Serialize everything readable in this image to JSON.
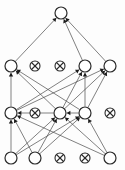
{
  "figure": {
    "width": 125,
    "height": 170,
    "background_color": "#fdfdfd",
    "node_fill_color": "#ffffff",
    "node_stroke_color": "#2b2b2b",
    "edge_color": "#4a4a4a",
    "arrow_color": "#1c1c1c"
  },
  "legend": {
    "open_circle_meaning": "open-circle-node",
    "crossed_circle_meaning": "crossed-out-circle-node"
  },
  "chart_data": {
    "type": "diagram",
    "subtype": "layered-directed-graph",
    "layers": [
      {
        "index": 0,
        "name": "row-top",
        "y": 13,
        "nodes": [
          {
            "id": "n0",
            "x": 61,
            "y": 13,
            "r": 6,
            "kind": "open",
            "label": ""
          }
        ]
      },
      {
        "index": 1,
        "name": "row-two",
        "y": 66,
        "nodes": [
          {
            "id": "n1",
            "x": 11,
            "y": 66,
            "r": 6,
            "kind": "open",
            "label": ""
          },
          {
            "id": "n2",
            "x": 35,
            "y": 66,
            "r": 5,
            "kind": "crossed",
            "label": ""
          },
          {
            "id": "n3",
            "x": 60,
            "y": 66,
            "r": 5,
            "kind": "crossed",
            "label": ""
          },
          {
            "id": "n4",
            "x": 85,
            "y": 66,
            "r": 6,
            "kind": "open",
            "label": ""
          },
          {
            "id": "n5",
            "x": 110,
            "y": 66,
            "r": 6,
            "kind": "open",
            "label": ""
          }
        ]
      },
      {
        "index": 2,
        "name": "row-three",
        "y": 113,
        "nodes": [
          {
            "id": "n6",
            "x": 11,
            "y": 113,
            "r": 6,
            "kind": "open",
            "label": ""
          },
          {
            "id": "n7",
            "x": 35,
            "y": 113,
            "r": 5,
            "kind": "crossed",
            "label": ""
          },
          {
            "id": "n8",
            "x": 60,
            "y": 113,
            "r": 6,
            "kind": "open",
            "label": ""
          },
          {
            "id": "n9",
            "x": 85,
            "y": 113,
            "r": 6,
            "kind": "open",
            "label": ""
          },
          {
            "id": "n10",
            "x": 110,
            "y": 113,
            "r": 5,
            "kind": "crossed",
            "label": ""
          }
        ]
      },
      {
        "index": 3,
        "name": "row-bottom",
        "y": 158,
        "nodes": [
          {
            "id": "n11",
            "x": 11,
            "y": 158,
            "r": 6,
            "kind": "open",
            "label": ""
          },
          {
            "id": "n12",
            "x": 35,
            "y": 158,
            "r": 6,
            "kind": "open",
            "label": ""
          },
          {
            "id": "n13",
            "x": 60,
            "y": 158,
            "r": 5,
            "kind": "crossed",
            "label": ""
          },
          {
            "id": "n14",
            "x": 85,
            "y": 158,
            "r": 5,
            "kind": "crossed",
            "label": ""
          },
          {
            "id": "n15",
            "x": 110,
            "y": 158,
            "r": 6,
            "kind": "open",
            "label": ""
          }
        ]
      }
    ],
    "edges": [
      {
        "from": "n1",
        "to": "n0",
        "directed": true
      },
      {
        "from": "n4",
        "to": "n0",
        "directed": true
      },
      {
        "from": "n5",
        "to": "n0",
        "directed": true
      },
      {
        "from": "n6",
        "to": "n1",
        "directed": true
      },
      {
        "from": "n8",
        "to": "n1",
        "directed": true
      },
      {
        "from": "n9",
        "to": "n1",
        "directed": true
      },
      {
        "from": "n6",
        "to": "n4",
        "directed": true
      },
      {
        "from": "n8",
        "to": "n4",
        "directed": true
      },
      {
        "from": "n9",
        "to": "n4",
        "directed": true
      },
      {
        "from": "n6",
        "to": "n5",
        "directed": true
      },
      {
        "from": "n8",
        "to": "n5",
        "directed": true
      },
      {
        "from": "n9",
        "to": "n5",
        "directed": true
      },
      {
        "from": "n11",
        "to": "n6",
        "directed": true
      },
      {
        "from": "n12",
        "to": "n6",
        "directed": true
      },
      {
        "from": "n15",
        "to": "n6",
        "directed": true
      },
      {
        "from": "n11",
        "to": "n8",
        "directed": true
      },
      {
        "from": "n12",
        "to": "n8",
        "directed": true
      },
      {
        "from": "n15",
        "to": "n8",
        "directed": true
      },
      {
        "from": "n11",
        "to": "n9",
        "directed": true
      },
      {
        "from": "n12",
        "to": "n9",
        "directed": true
      },
      {
        "from": "n15",
        "to": "n9",
        "directed": true
      },
      {
        "from": "n8",
        "to": "n6",
        "directed": true
      },
      {
        "from": "n9",
        "to": "n8",
        "directed": true
      }
    ],
    "xlabel": "",
    "ylabel": "",
    "grid": false,
    "legend_position": "none"
  }
}
